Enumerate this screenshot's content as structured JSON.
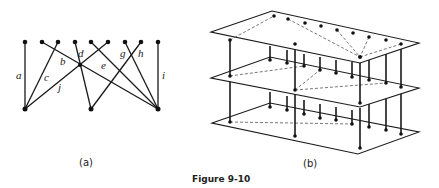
{
  "figure": {
    "caption": "Figure 9-10",
    "panel_a_label": "(a)",
    "panel_b_label": "(b)"
  },
  "panel_a": {
    "type": "bipartite-graph",
    "top_nodes": [
      [
        25,
        42
      ],
      [
        42,
        42
      ],
      [
        58,
        42
      ],
      [
        75,
        42
      ],
      [
        91,
        42
      ],
      [
        108,
        42
      ],
      [
        125,
        42
      ],
      [
        141,
        42
      ],
      [
        158,
        42
      ]
    ],
    "bottom_nodes": [
      [
        25,
        109
      ],
      [
        91,
        109
      ],
      [
        158,
        109
      ]
    ],
    "junction_node": [
      80,
      65
    ],
    "edges": [
      {
        "label": "a",
        "from": [
          25,
          42
        ],
        "to": [
          25,
          109
        ],
        "label_pos": [
          19,
          78
        ]
      },
      {
        "label": "b",
        "from": [
          42,
          42
        ],
        "to": [
          158,
          109
        ],
        "label_pos": [
          62,
          64
        ]
      },
      {
        "label": "c",
        "from": [
          58,
          42
        ],
        "to": [
          25,
          109
        ],
        "label_pos": [
          45,
          80
        ]
      },
      {
        "label": "d",
        "from": [
          75,
          42
        ],
        "to": [
          91,
          109
        ],
        "label_pos": [
          80,
          56
        ]
      },
      {
        "label": "e",
        "from": [
          91,
          42
        ],
        "to": [
          158,
          109
        ],
        "label_pos": [
          102,
          68
        ]
      },
      {
        "label": "j",
        "from": [
          108,
          42
        ],
        "to": [
          25,
          109
        ],
        "label_pos": [
          58,
          89
        ]
      },
      {
        "label": "g",
        "from": [
          125,
          42
        ],
        "to": [
          158,
          109
        ],
        "label_pos": [
          121,
          56
        ]
      },
      {
        "label": "h",
        "from": [
          141,
          42
        ],
        "to": [
          91,
          109
        ],
        "label_pos": [
          138,
          56
        ]
      },
      {
        "label": "i",
        "from": [
          158,
          42
        ],
        "to": [
          158,
          109
        ],
        "label_pos": [
          163,
          78
        ]
      }
    ]
  },
  "panel_b": {
    "type": "three-layer-board",
    "plates": [
      {
        "name": "top",
        "corners": [
          [
            211,
            32
          ],
          [
            272,
            11
          ],
          [
            419,
            43
          ],
          [
            360,
            63
          ]
        ]
      },
      {
        "name": "middle",
        "corners": [
          [
            211,
            78
          ],
          [
            270,
            57
          ],
          [
            419,
            88
          ],
          [
            360,
            107
          ]
        ]
      },
      {
        "name": "bottom",
        "corners": [
          [
            212,
            123
          ],
          [
            270,
            103
          ],
          [
            419,
            132
          ],
          [
            358,
            154
          ]
        ]
      }
    ]
  }
}
